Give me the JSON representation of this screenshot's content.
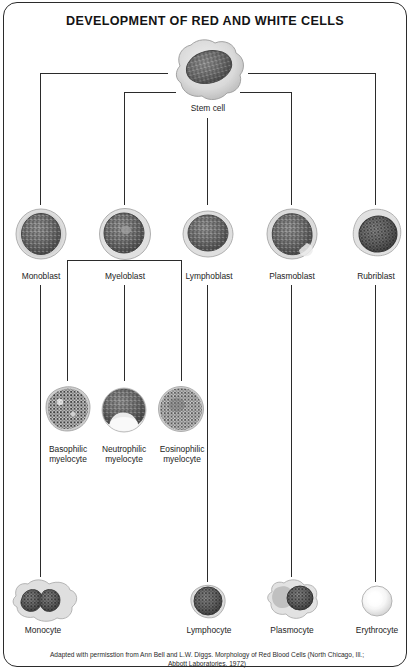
{
  "figure": {
    "title": "DEVELOPMENT OF RED AND WHITE CELLS",
    "caption_line1": "Adapted with permisstion from Ann Bell and L.W. Diggs. Morphology of Red Blood Cells (North Chicago, Ill.;",
    "caption_italic": "Morphology of Red Blood Cells",
    "caption_line2": "Abbott Laboratories, 1972)",
    "border_color": "#2b2b2b",
    "line_color": "#2b2b2b",
    "text_color": "#1d1d1d"
  },
  "nodes": {
    "stem": {
      "label": "Stem cell"
    },
    "blasts": [
      {
        "label": "Monoblast"
      },
      {
        "label": "Myeloblast"
      },
      {
        "label": "Lymphoblast"
      },
      {
        "label": "Plasmoblast"
      },
      {
        "label": "Rubriblast"
      }
    ],
    "myelocytes": [
      {
        "label": "Basophilic\nmyelocyte"
      },
      {
        "label": "Neutrophilic\nmyelocyte"
      },
      {
        "label": "Eosinophilic\nmyelocyte"
      }
    ],
    "mature": [
      {
        "label": "Monocyte"
      },
      {
        "label": "Lymphocyte"
      },
      {
        "label": "Plasmocyte"
      },
      {
        "label": "Erythrocyte"
      }
    ]
  }
}
